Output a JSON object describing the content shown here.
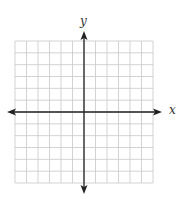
{
  "diagram": {
    "type": "coordinate-plane",
    "x_axis_label": "x",
    "y_axis_label": "y",
    "grid": {
      "columns": 12,
      "rows": 12,
      "left": 15,
      "top": 41,
      "right": 153,
      "bottom": 183,
      "line_color": "#c8c8c8"
    },
    "axes": {
      "color": "#222222",
      "origin_x": 84,
      "origin_y": 112,
      "x_start": 7,
      "x_end": 162,
      "y_start": 31,
      "y_end": 194
    }
  }
}
